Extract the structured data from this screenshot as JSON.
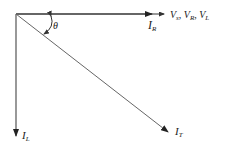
{
  "diagram": {
    "title": "",
    "type": "phasor-diagram",
    "origin": [
      16,
      14
    ],
    "vectors": [
      {
        "id": "I_R",
        "label_main": "I",
        "label_sub": "R",
        "from": [
          16,
          14
        ],
        "to": [
          152,
          14
        ],
        "color": "#333333"
      },
      {
        "id": "V_ref",
        "from": [
          152,
          14
        ],
        "to": [
          164,
          14
        ],
        "color": "#333333"
      },
      {
        "id": "I_L",
        "label_main": "I",
        "label_sub": "L",
        "from": [
          16,
          14
        ],
        "to": [
          16,
          136
        ],
        "color": "#333333"
      },
      {
        "id": "I_T",
        "label_main": "I",
        "label_sub": "T",
        "from": [
          16,
          14
        ],
        "to": [
          168,
          132
        ],
        "color": "#555555"
      }
    ],
    "labels": {
      "voltages": {
        "v1_main": "V",
        "v1_sub": "s",
        "sep1": ", ",
        "v2_main": "V",
        "v2_sub": "R",
        "sep2": ", ",
        "v3_main": "V",
        "v3_sub": "L"
      },
      "i_r": {
        "main": "I",
        "sub": "R"
      },
      "i_l": {
        "main": "I",
        "sub": "L"
      },
      "i_t": {
        "main": "I",
        "sub": "T"
      },
      "theta": "θ"
    },
    "angle": {
      "symbol": "θ",
      "between": [
        "I_R",
        "I_T"
      ]
    }
  }
}
